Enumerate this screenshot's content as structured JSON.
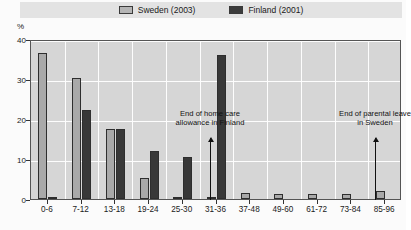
{
  "legend": {
    "entries": [
      {
        "label": "Sweden (2003)",
        "color": "#a9a9a9",
        "key": "sweden"
      },
      {
        "label": "Finland (2001)",
        "color": "#383838",
        "key": "finland"
      }
    ]
  },
  "axis": {
    "unit": "%",
    "yticks": [
      "0",
      "10",
      "20",
      "30",
      "40"
    ]
  },
  "annotations": [
    {
      "line1": "End of home care",
      "line2": "allowance in Finland"
    },
    {
      "line1": "End of parental leave",
      "line2": "in Sweden"
    }
  ],
  "chart_data": {
    "type": "bar",
    "title": "",
    "subtitle": "",
    "xlabel": "",
    "ylabel": "%",
    "ylim": [
      0,
      40
    ],
    "yticks": [
      0,
      10,
      20,
      30,
      40
    ],
    "grid": true,
    "legend_position": "top-center",
    "categories": [
      "0-6",
      "7-12",
      "13-18",
      "19-24",
      "25-30",
      "31-36",
      "37-48",
      "49-60",
      "61-72",
      "73-84",
      "85-96"
    ],
    "series": [
      {
        "name": "Sweden (2003)",
        "color": "#a9a9a9",
        "values": [
          36.6,
          30.3,
          17.5,
          5.2,
          0.6,
          0.3,
          1.6,
          1.2,
          1.2,
          1.2,
          2.0
        ]
      },
      {
        "name": "Finland (2001)",
        "color": "#383838",
        "values": [
          0.3,
          22.2,
          17.4,
          12.0,
          10.6,
          36.0,
          0.0,
          0.0,
          0.0,
          0.0,
          0.0
        ]
      }
    ],
    "annotations": [
      {
        "text": "End of home care allowance in Finland",
        "at_category": "37-48"
      },
      {
        "text": "End of parental leave in Sweden",
        "at_category": "85-96"
      }
    ]
  }
}
